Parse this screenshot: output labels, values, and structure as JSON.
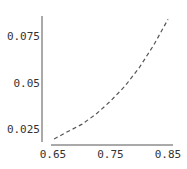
{
  "chart_data": {
    "type": "line",
    "title": "",
    "xlabel": "",
    "ylabel": "",
    "xlim": [
      0.65,
      0.85
    ],
    "ylim": [
      0.018,
      0.086
    ],
    "grid": false,
    "legend": null,
    "x_ticks": [
      "0.65",
      "0.75",
      "0.85"
    ],
    "y_ticks": [
      "0.025",
      "0.05",
      "0.075"
    ],
    "series": [
      {
        "name": "curve",
        "style": "dashed",
        "color": "#555555",
        "x": [
          0.652,
          0.675,
          0.7,
          0.725,
          0.75,
          0.775,
          0.8,
          0.825,
          0.85
        ],
        "y": [
          0.0196,
          0.0235,
          0.0275,
          0.033,
          0.04,
          0.048,
          0.058,
          0.07,
          0.084
        ]
      }
    ]
  }
}
